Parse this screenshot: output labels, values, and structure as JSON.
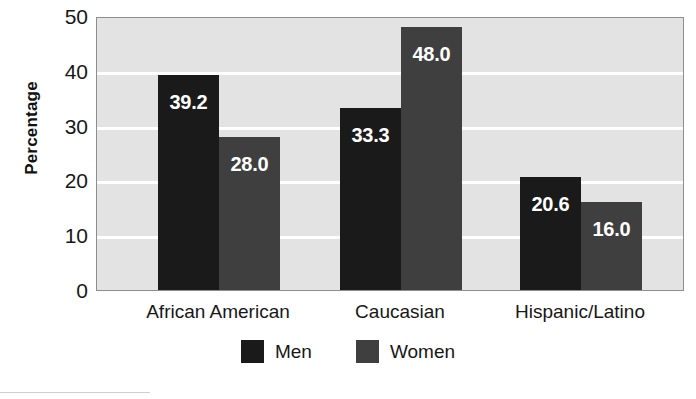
{
  "chart_data": {
    "type": "bar",
    "title": "",
    "xlabel": "",
    "ylabel": "Percentage",
    "categories": [
      "African American",
      "Caucasian",
      "Hispanic/Latino"
    ],
    "series": [
      {
        "name": "Men",
        "color": "#1a1a1a",
        "values": [
          39.2,
          33.3,
          20.6
        ],
        "labels": [
          "39.2",
          "33.3",
          "20.6"
        ]
      },
      {
        "name": "Women",
        "color": "#3f3f3f",
        "values": [
          28.0,
          48.0,
          16.0
        ],
        "labels": [
          "28.0",
          "48.0",
          "16.0"
        ]
      }
    ],
    "ylim": [
      0,
      50
    ],
    "yticks": [
      0,
      10,
      20,
      30,
      40,
      50
    ],
    "ytick_labels": [
      "0",
      "10",
      "20",
      "30",
      "40",
      "50"
    ],
    "grid": true,
    "gridline_values": [
      10,
      20,
      30,
      40
    ],
    "legend_position": "bottom-center",
    "plot_background": "#e3e3e3",
    "gridline_color": "#ffffff",
    "border_color": "#8d8d8d",
    "data_label_color": "#ffffff"
  },
  "axes": {
    "y_title": "Percentage"
  }
}
